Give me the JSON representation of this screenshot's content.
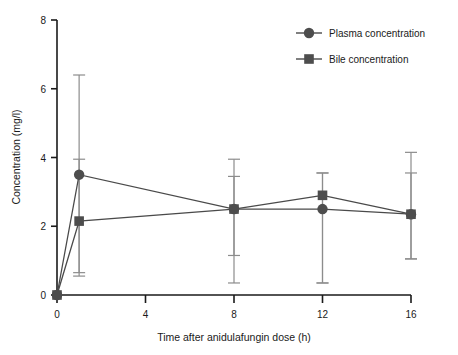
{
  "chart_data": {
    "type": "line",
    "title": "",
    "xlabel": "Time after anidulafungin dose (h)",
    "ylabel": "Concentration (mg/l)",
    "xlim": [
      0,
      16
    ],
    "ylim": [
      0,
      8
    ],
    "xticks": [
      0,
      4,
      8,
      12,
      16
    ],
    "yticks": [
      0,
      2,
      4,
      6,
      8
    ],
    "xtick_labels": [
      "0",
      "4",
      "8",
      "12",
      "16"
    ],
    "ytick_labels": [
      "0",
      "2",
      "4",
      "6",
      "8"
    ],
    "grid": false,
    "legend_position": "top-right",
    "x": [
      0,
      1,
      8,
      12,
      16
    ],
    "series": [
      {
        "name": "Plasma concentration",
        "marker": "circle",
        "color": "#4d4d4d",
        "values": [
          0.0,
          3.5,
          2.5,
          2.5,
          2.35
        ],
        "err_low": [
          0.0,
          0.55,
          1.15,
          0.35,
          1.05
        ],
        "err_high": [
          0.0,
          6.4,
          3.45,
          3.55,
          3.55
        ]
      },
      {
        "name": "Bile concentration",
        "marker": "square",
        "color": "#4d4d4d",
        "values": [
          0.0,
          2.15,
          2.5,
          2.9,
          2.35
        ],
        "err_low": [
          0.0,
          0.65,
          0.35,
          0.35,
          1.05
        ],
        "err_high": [
          0.0,
          3.95,
          3.95,
          3.55,
          4.15
        ]
      }
    ]
  },
  "legend": {
    "items": [
      {
        "label": "Plasma concentration",
        "marker": "circle-marker"
      },
      {
        "label": "Bile concentration",
        "marker": "square-marker"
      }
    ]
  },
  "axes": {
    "x_title": "Time after anidulafungin dose (h)",
    "y_title": "Concentration (mg/l)"
  }
}
